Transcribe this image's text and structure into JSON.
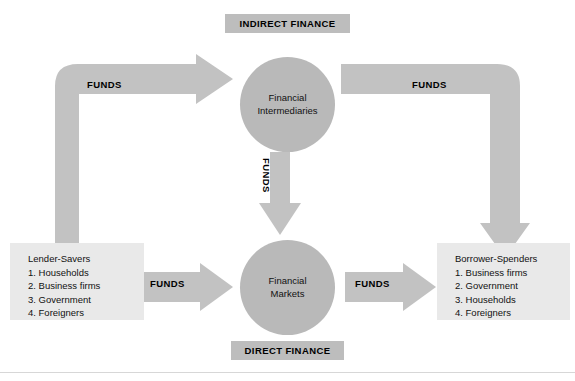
{
  "diagram": {
    "colors": {
      "arrow_fill": "#c2c2c2",
      "circle_fill": "#b9b9b9",
      "banner_fill": "#bdbdbd",
      "box_fill": "#e9e9e9",
      "text": "#111111",
      "page_background": "#ffffff",
      "rule": "#d7d7d7"
    },
    "banners": {
      "indirect": "INDIRECT FINANCE",
      "direct": "DIRECT FINANCE"
    },
    "nodes": {
      "intermediaries": {
        "line1": "Financial",
        "line2": "Intermediaries"
      },
      "markets": {
        "line1": "Financial",
        "line2": "Markets"
      }
    },
    "parties": {
      "lender_savers": {
        "title": "Lender-Savers",
        "items": [
          "1. Households",
          "2. Business firms",
          "3. Government",
          "4. Foreigners"
        ]
      },
      "borrower_spenders": {
        "title": "Borrower-Spenders",
        "items": [
          "1. Business firms",
          "2. Government",
          "3. Households",
          "4. Foreigners"
        ]
      }
    },
    "arrows": {
      "top_left": {
        "label": "FUNDS",
        "from": "lender_savers",
        "to": "intermediaries",
        "direction": "up-then-right"
      },
      "top_right": {
        "label": "FUNDS",
        "from": "intermediaries",
        "to": "borrower_spenders",
        "direction": "right-then-down"
      },
      "middle": {
        "label": "FUNDS",
        "from": "intermediaries",
        "to": "markets",
        "direction": "down"
      },
      "bottom_left": {
        "label": "FUNDS",
        "from": "lender_savers",
        "to": "markets",
        "direction": "right"
      },
      "bottom_right": {
        "label": "FUNDS",
        "from": "markets",
        "to": "borrower_spenders",
        "direction": "right"
      }
    }
  }
}
